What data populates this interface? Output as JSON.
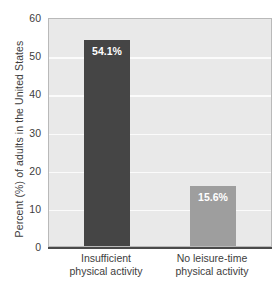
{
  "chart_data": {
    "type": "bar",
    "title": "",
    "xlabel": "",
    "ylabel": "Percent (%) of adults in the United States",
    "ylim": [
      0,
      60
    ],
    "ytick_labels": [
      "60",
      "50",
      "40",
      "30",
      "20",
      "10",
      "0"
    ],
    "ytick_values": [
      60,
      50,
      40,
      30,
      20,
      10,
      0
    ],
    "grid": true,
    "grid_color": "#fbfbfb",
    "plot_background": "#e9e9e9",
    "legend": "none",
    "categories": [
      "Insufficient physical activity",
      "No leisure-time physical activity"
    ],
    "category_lines": [
      [
        "Insufficient",
        "physical activity"
      ],
      [
        "No leisure-time",
        "physical activity"
      ]
    ],
    "values": [
      54.1,
      15.6
    ],
    "value_labels": [
      "54.1%",
      "15.6%"
    ],
    "bar_colors": [
      "#454545",
      "#9e9e9e"
    ],
    "value_label_color": "#ffffff"
  },
  "axis": {
    "y_title": "Percent (%) of adults in the United States"
  }
}
